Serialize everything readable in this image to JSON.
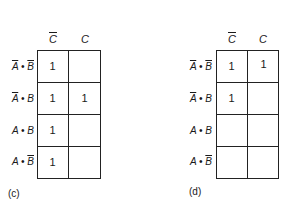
{
  "maps": [
    {
      "id": "c",
      "caption": "(c)",
      "columns": [
        "C̄",
        "C"
      ],
      "column_labels": [
        {
          "var": "C",
          "negated": true
        },
        {
          "var": "C",
          "negated": false
        }
      ],
      "rows": [
        {
          "label": {
            "a": "A",
            "a_neg": true,
            "op": "•",
            "b": "B",
            "b_neg": true
          },
          "cells": [
            "1",
            ""
          ]
        },
        {
          "label": {
            "a": "A",
            "a_neg": true,
            "op": "•",
            "b": "B",
            "b_neg": false
          },
          "cells": [
            "1",
            "1"
          ]
        },
        {
          "label": {
            "a": "A",
            "a_neg": false,
            "op": "•",
            "b": "B",
            "b_neg": false
          },
          "cells": [
            "1",
            ""
          ]
        },
        {
          "label": {
            "a": "A",
            "a_neg": false,
            "op": "•",
            "b": "B",
            "b_neg": true
          },
          "cells": [
            "1",
            ""
          ]
        }
      ]
    },
    {
      "id": "d",
      "caption": "(d)",
      "columns": [
        "C̄",
        "C"
      ],
      "column_labels": [
        {
          "var": "C",
          "negated": true
        },
        {
          "var": "C",
          "negated": false
        }
      ],
      "rows": [
        {
          "label": {
            "a": "A",
            "a_neg": true,
            "op": "•",
            "b": "B",
            "b_neg": true
          },
          "cells": [
            "1",
            "1"
          ]
        },
        {
          "label": {
            "a": "A",
            "a_neg": true,
            "op": "•",
            "b": "B",
            "b_neg": false
          },
          "cells": [
            "1",
            ""
          ]
        },
        {
          "label": {
            "a": "A",
            "a_neg": false,
            "op": "•",
            "b": "B",
            "b_neg": false
          },
          "cells": [
            "",
            ""
          ]
        },
        {
          "label": {
            "a": "A",
            "a_neg": false,
            "op": "•",
            "b": "B",
            "b_neg": true
          },
          "cells": [
            "",
            ""
          ]
        }
      ]
    }
  ]
}
